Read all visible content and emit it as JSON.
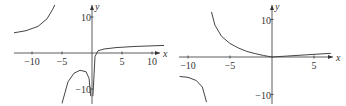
{
  "chart_data": [
    {
      "type": "line",
      "title": "",
      "xlabel": "x",
      "ylabel": "y",
      "xlim": [
        -13,
        12
      ],
      "ylim": [
        -12,
        12
      ],
      "xticks": [
        -10,
        -5,
        5,
        10
      ],
      "yticks": [
        10,
        -10
      ],
      "grid": false,
      "vertical_asymptotes": [
        -6,
        0
      ],
      "series": [
        {
          "name": "branch-left",
          "x": [
            -13,
            -11,
            -9,
            -7.5,
            -6.6,
            -6.2
          ],
          "y": [
            5.6,
            6.2,
            7.4,
            9.5,
            12,
            14
          ]
        },
        {
          "name": "branch-middle",
          "x": [
            -5,
            -4,
            -3,
            -2,
            -1,
            -0.5,
            -0.2
          ],
          "y": [
            -14,
            -8,
            -5.6,
            -4.8,
            -5.2,
            -7,
            -12
          ]
        },
        {
          "name": "branch-right",
          "x": [
            0.15,
            0.5,
            1,
            2,
            4,
            7,
            12
          ],
          "y": [
            -12,
            -1,
            0.6,
            1.1,
            1.5,
            1.8,
            2.1
          ]
        }
      ]
    },
    {
      "type": "line",
      "title": "",
      "xlabel": "x",
      "ylabel": "y",
      "xlim": [
        -11,
        7
      ],
      "ylim": [
        -12,
        12
      ],
      "xticks": [
        -10,
        -5,
        5
      ],
      "yticks": [
        10,
        -10
      ],
      "grid": false,
      "vertical_asymptotes": [
        -7.5
      ],
      "series": [
        {
          "name": "branch-left",
          "x": [
            -11,
            -10,
            -9,
            -8.3,
            -7.8
          ],
          "y": [
            -5.2,
            -5.4,
            -6.3,
            -8,
            -12
          ]
        },
        {
          "name": "branch-right",
          "x": [
            -7.2,
            -6.8,
            -6,
            -5,
            -4,
            -3,
            -2,
            -1,
            0
          ],
          "y": [
            12,
            8.5,
            5.5,
            3.6,
            2.4,
            1.5,
            0.9,
            0.4,
            0
          ]
        },
        {
          "name": "line-right",
          "x": [
            0,
            7
          ],
          "y": [
            0,
            1
          ]
        }
      ]
    }
  ]
}
